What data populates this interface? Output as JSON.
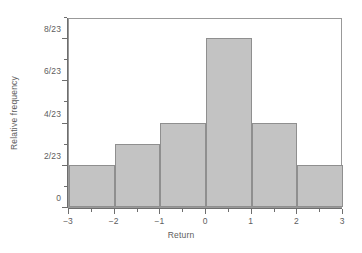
{
  "chart_data": {
    "type": "bar",
    "title": "",
    "subtitle": "",
    "xlabel": "Return",
    "ylabel": "Relative frequency",
    "categories": [
      "-3 to -2",
      "-2 to -1",
      "-1 to 0",
      "0 to 1",
      "1 to 2",
      "2 to 3"
    ],
    "bin_edges": [
      -3,
      -2,
      -1,
      0,
      1,
      2,
      3
    ],
    "values": [
      0.08696,
      0.13043,
      0.17391,
      0.34783,
      0.17391,
      0.08696
    ],
    "value_labels": [
      "2/23",
      "3/23",
      "4/23",
      "8/23",
      "4/23",
      "2/23"
    ],
    "counts": [
      2,
      3,
      4,
      8,
      4,
      2
    ],
    "denominator": 23,
    "xlim": [
      -3,
      3
    ],
    "ylim": [
      0,
      0.3913
    ],
    "ylim_units": [
      0,
      9
    ],
    "x_ticks": [
      -3,
      -2,
      -1,
      0,
      1,
      2,
      3
    ],
    "x_tick_labels": [
      "−3",
      "−2",
      "−1",
      "0",
      "1",
      "2",
      "3"
    ],
    "x_minor_ticks": [
      -2.5,
      -1.5,
      -0.5,
      0.5,
      1.5,
      2.5
    ],
    "y_ticks_units": [
      0,
      2,
      4,
      6,
      8
    ],
    "y_tick_labels": [
      "0",
      "2/23",
      "4/23",
      "6/23",
      "8/23"
    ],
    "y_minor_ticks_units": [
      1,
      3,
      5,
      7,
      9
    ],
    "grid": false,
    "legend": null,
    "bar_fill_color": "#c3c3c3",
    "bar_edge_color": "#8f8f8f",
    "axis_color": "#6e6e6e",
    "frame_color": "#999999",
    "text_color": "#5d5d5d",
    "background_color": "#ffffff"
  }
}
